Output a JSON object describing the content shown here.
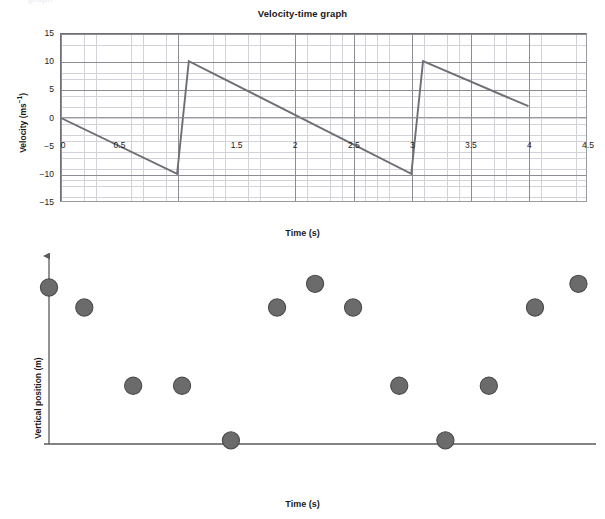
{
  "page": {
    "artifact_text": "graph",
    "background": "#ffffff"
  },
  "chart1": {
    "title": "Velocity-time graph",
    "y_axis_title_main": "Velocity (ms",
    "y_axis_title_sup": "−1",
    "y_axis_title_close": ")",
    "x_axis_title": "Time (s)",
    "y_ticks": [
      "15",
      "10",
      "5",
      "0",
      "−5",
      "−10",
      "−15"
    ],
    "x_ticks": [
      "0",
      "0.5",
      "1",
      "1.5",
      "2",
      "2.5",
      "3",
      "3.5",
      "4",
      "4.5"
    ],
    "x_ticks_visible": [
      "0",
      "0.5",
      "1.5",
      "2",
      "2.5",
      "3",
      "3.5",
      "4",
      "4.5"
    ],
    "line_color": "#6e6e75",
    "grid_major_color": "#8c8c93",
    "grid_minor_color": "#d2d2d8"
  },
  "chart2": {
    "y_axis_title": "Vertical position (m)",
    "x_axis_title": "Time (s)",
    "marker_fill": "#6b6b6b",
    "marker_stroke": "#4a4a4a",
    "axis_color": "#5a5a5a"
  },
  "chart_data": [
    {
      "type": "line",
      "title": "Velocity-time graph",
      "xlabel": "Time (s)",
      "ylabel": "Velocity (ms−1)",
      "xlim": [
        0,
        4.5
      ],
      "ylim": [
        -15,
        15
      ],
      "grid": true,
      "x_major_step": 0.5,
      "y_major_step": 5,
      "x_minor_per_major": 5,
      "y_minor_per_major": 5,
      "legend": "none",
      "series": [
        {
          "name": "velocity",
          "points": [
            [
              0.0,
              0.0
            ],
            [
              1.0,
              -10.0
            ],
            [
              1.1,
              10.0
            ],
            [
              3.0,
              -10.0
            ],
            [
              3.1,
              10.0
            ],
            [
              4.0,
              2.0
            ]
          ]
        }
      ],
      "annotations": [
        "sawtooth waveform: linear decrease at -10 ms^-2 punctuated by instantaneous jumps from -10 to +10 ms^-1 at t = 1.0 s and t = 3.0 s"
      ]
    },
    {
      "type": "scatter",
      "title": "",
      "xlabel": "Time (s)",
      "ylabel": "Vertical position (m)",
      "xlim": [
        0,
        10
      ],
      "ylim": [
        0,
        5
      ],
      "grid": false,
      "legend": "none",
      "axes_style": "arrow-axes-no-ticks",
      "series": [
        {
          "name": "vertical position of bouncing ball",
          "points": [
            [
              0.0,
              4.3
            ],
            [
              0.65,
              3.75
            ],
            [
              1.55,
              1.6
            ],
            [
              2.45,
              1.6
            ],
            [
              3.35,
              0.1
            ],
            [
              4.2,
              3.75
            ],
            [
              4.9,
              4.4
            ],
            [
              5.6,
              3.75
            ],
            [
              6.45,
              1.6
            ],
            [
              7.3,
              0.1
            ],
            [
              8.1,
              1.6
            ],
            [
              8.95,
              3.75
            ],
            [
              9.75,
              4.4
            ]
          ]
        }
      ],
      "annotations": [
        "eleven to thirteen markers arranged at four discrete heights forming a repeating bounce pattern"
      ]
    }
  ]
}
